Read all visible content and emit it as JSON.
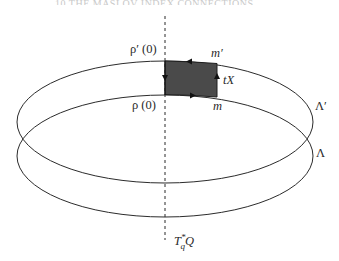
{
  "page": {
    "running_header": "10 THE MASLOV INDEX CONNECTIONS"
  },
  "figure": {
    "labels": {
      "rho_prime_zero": "ρ′ (0)",
      "rho_zero": "ρ (0)",
      "m_prime": "m′",
      "m": "m",
      "tX": "tX",
      "lambda_prime": "Λ′",
      "lambda": "Λ",
      "fiber_main": "T",
      "fiber_sup": "*",
      "fiber_sub": "q",
      "fiber_tail": "Q"
    },
    "colors": {
      "stroke": "#2b2b2b",
      "shaded_region": "#4a4a4a",
      "background": "#ffffff"
    }
  }
}
